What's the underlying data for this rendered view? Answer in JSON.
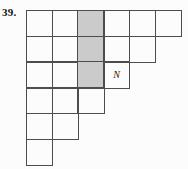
{
  "figure": {
    "problem_number": "39.",
    "grid": {
      "cells_per_row": [
        6,
        5,
        4,
        3,
        2,
        1
      ],
      "shaded_cells": [
        [
          1,
          3
        ],
        [
          2,
          3
        ],
        [
          3,
          3
        ]
      ],
      "labeled_cell": {
        "row": 3,
        "col": 4,
        "label": "N"
      }
    },
    "colors": {
      "background": "#fcfcfc",
      "grid_line": "#4d4d4d",
      "shaded_fill": "#cbcbcb",
      "text": "#111111"
    }
  }
}
